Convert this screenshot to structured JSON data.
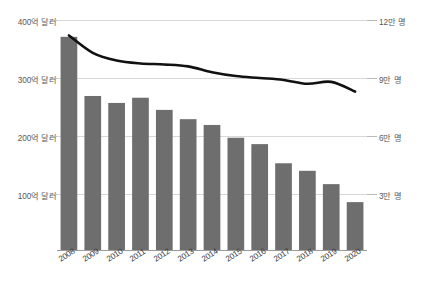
{
  "chart_data": {
    "type": "bar",
    "title": "",
    "subtitle": "",
    "xlabel": "",
    "ylabel": "",
    "categories": [
      "2008",
      "2009",
      "2010",
      "2011",
      "2012",
      "2013",
      "2014",
      "2015",
      "2016",
      "2017",
      "2018",
      "2019",
      "2020"
    ],
    "series": [
      {
        "name": "금액",
        "type": "bar",
        "axis": "left",
        "unit": "억 달러",
        "color": "#6e6e6e",
        "values": [
          371,
          269,
          257,
          266,
          245,
          229,
          219,
          197,
          186,
          153,
          140,
          117,
          86
        ]
      },
      {
        "name": "인원",
        "type": "line",
        "axis": "right",
        "unit": "만 명",
        "color": "#111111",
        "values": [
          11.2,
          10.3,
          9.9,
          9.75,
          9.7,
          9.6,
          9.3,
          9.1,
          9.0,
          8.9,
          8.7,
          8.8,
          8.3
        ]
      }
    ],
    "left_axis": {
      "ticks": [
        {
          "value": 100,
          "label": "100억 달러"
        },
        {
          "value": 200,
          "label": "200억 달러"
        },
        {
          "value": 300,
          "label": "300억 달러"
        },
        {
          "value": 400,
          "label": "400억 달러"
        }
      ],
      "ylim": [
        0,
        400
      ],
      "unit": "억 달러"
    },
    "right_axis": {
      "ticks": [
        {
          "value": 3,
          "label": "3만 명"
        },
        {
          "value": 6,
          "label": "6만 명"
        },
        {
          "value": 9,
          "label": "9만 명"
        },
        {
          "value": 12,
          "label": "12만 명"
        }
      ],
      "ylim": [
        0,
        12
      ],
      "unit": "만 명"
    },
    "grid": true,
    "legend": "none",
    "background": "#ffffff"
  },
  "axis": {
    "left_tick_0": "400억 달러",
    "left_tick_1": "300억 달러",
    "left_tick_2": "200억 달러",
    "left_tick_3": "100억 달러",
    "right_tick_0": "12만 명",
    "right_tick_1": "9만 명",
    "right_tick_2": "6만 명",
    "right_tick_3": "3만 명"
  },
  "x_labels": {
    "y0": "2008",
    "y1": "2009",
    "y2": "2010",
    "y3": "2011",
    "y4": "2012",
    "y5": "2013",
    "y6": "2014",
    "y7": "2015",
    "y8": "2016",
    "y9": "2017",
    "y10": "2018",
    "y11": "2019",
    "y12": "2020"
  }
}
